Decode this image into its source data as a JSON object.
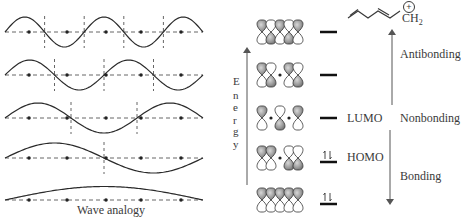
{
  "left_panel": {
    "caption": "Wave analogy",
    "rows": [
      {
        "half_waves": 5,
        "baseline_y": 32
      },
      {
        "half_waves": 4,
        "baseline_y": 75
      },
      {
        "half_waves": 3,
        "baseline_y": 118
      },
      {
        "half_waves": 2,
        "baseline_y": 158
      },
      {
        "half_waves": 1,
        "baseline_y": 200
      }
    ],
    "dot_x": [
      29,
      67,
      106,
      141,
      181
    ],
    "x_start": 5,
    "x_end": 203
  },
  "right_panel": {
    "molecule": {
      "charge": "+",
      "group": "CH",
      "subscript": "2"
    },
    "energy_axis_label": [
      "E",
      "n",
      "e",
      "r",
      "g",
      "y"
    ],
    "levels": [
      {
        "name": "psi5",
        "y": 32,
        "electrons": 0,
        "label": "",
        "nodes": 4
      },
      {
        "name": "psi4",
        "y": 75,
        "electrons": 0,
        "label": "",
        "nodes": 3
      },
      {
        "name": "psi3",
        "y": 118,
        "electrons": 0,
        "label": "LUMO",
        "nodes": 2
      },
      {
        "name": "psi2",
        "y": 158,
        "electrons": 2,
        "label": "HOMO",
        "nodes": 1
      },
      {
        "name": "psi1",
        "y": 200,
        "electrons": 2,
        "label": "",
        "nodes": 0
      }
    ],
    "regions": {
      "antibonding": "Antibonding",
      "nonbonding": "Nonbonding",
      "bonding": "Bonding"
    }
  },
  "colors": {
    "line": "#2a2a2a",
    "dashed": "#555555",
    "lobe_shaded": "#9a9a9a",
    "lobe_dark": "#6e6e6e",
    "text": "#3a3a3a",
    "arrow": "#555555"
  }
}
